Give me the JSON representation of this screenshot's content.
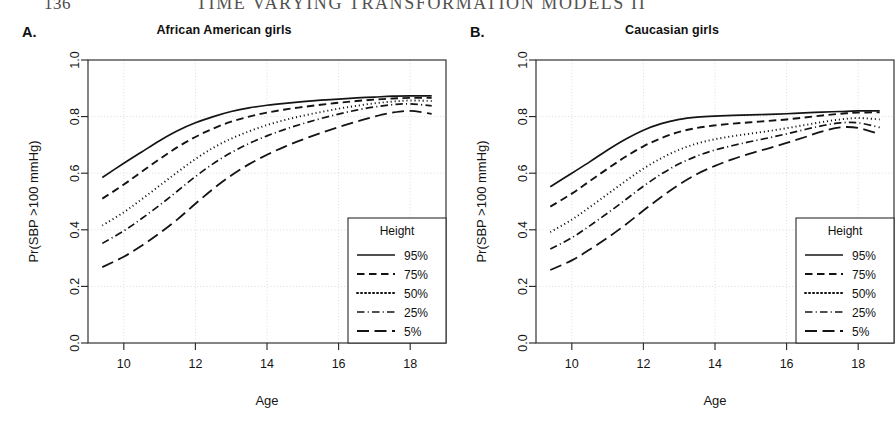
{
  "header": {
    "page_number": "136",
    "running_title": "TIME VARYING TRANSFORMATION MODELS  II"
  },
  "panels": [
    {
      "letter": "A.",
      "title": "African American girls",
      "xlabel": "Age",
      "ylabel": "Pr(SBP >100 mmHg)",
      "legend_title": "Height"
    },
    {
      "letter": "B.",
      "title": "Caucasian girls",
      "xlabel": "Age",
      "ylabel": "Pr(SBP >100 mmHg)",
      "legend_title": "Height"
    }
  ],
  "chart_data": [
    {
      "type": "line",
      "panel": "A",
      "title": "African American girls",
      "xlabel": "Age",
      "ylabel": "Pr(SBP >100 mmHg)",
      "xlim": [
        9.0,
        19.0
      ],
      "ylim": [
        0.0,
        1.0
      ],
      "xticks": [
        10,
        12,
        14,
        16,
        18
      ],
      "yticks": [
        0.0,
        0.2,
        0.4,
        0.6,
        0.8,
        1.0
      ],
      "grid": true,
      "legend_position": "bottom-right",
      "legend_title": "Height",
      "x": [
        9.4,
        10,
        10.5,
        11,
        11.5,
        12,
        12.5,
        13,
        13.5,
        14,
        14.5,
        15,
        15.5,
        16,
        16.5,
        17,
        17.5,
        18,
        18.6
      ],
      "series": [
        {
          "name": "95%",
          "dash": "solid",
          "values": [
            0.585,
            0.635,
            0.675,
            0.715,
            0.75,
            0.778,
            0.8,
            0.818,
            0.831,
            0.84,
            0.847,
            0.853,
            0.858,
            0.862,
            0.866,
            0.869,
            0.872,
            0.873,
            0.873
          ]
        },
        {
          "name": "75%",
          "dash": "dashed",
          "values": [
            0.51,
            0.56,
            0.605,
            0.65,
            0.692,
            0.728,
            0.758,
            0.782,
            0.8,
            0.814,
            0.825,
            0.834,
            0.842,
            0.849,
            0.855,
            0.86,
            0.864,
            0.866,
            0.866
          ]
        },
        {
          "name": "50%",
          "dash": "dotted",
          "values": [
            0.415,
            0.462,
            0.508,
            0.556,
            0.604,
            0.65,
            0.69,
            0.722,
            0.748,
            0.77,
            0.788,
            0.803,
            0.816,
            0.828,
            0.838,
            0.847,
            0.853,
            0.857,
            0.855
          ]
        },
        {
          "name": "25%",
          "dash": "dashdot",
          "values": [
            0.352,
            0.396,
            0.44,
            0.487,
            0.537,
            0.588,
            0.634,
            0.673,
            0.705,
            0.732,
            0.755,
            0.775,
            0.793,
            0.809,
            0.823,
            0.834,
            0.842,
            0.845,
            0.838
          ]
        },
        {
          "name": "5%",
          "dash": "longdash",
          "values": [
            0.268,
            0.305,
            0.344,
            0.388,
            0.437,
            0.492,
            0.545,
            0.592,
            0.632,
            0.665,
            0.694,
            0.719,
            0.742,
            0.763,
            0.782,
            0.8,
            0.814,
            0.82,
            0.81
          ]
        }
      ]
    },
    {
      "type": "line",
      "panel": "B",
      "title": "Caucasian girls",
      "xlabel": "Age",
      "ylabel": "Pr(SBP >100 mmHg)",
      "xlim": [
        9.0,
        19.0
      ],
      "ylim": [
        0.0,
        1.0
      ],
      "xticks": [
        10,
        12,
        14,
        16,
        18
      ],
      "yticks": [
        0.0,
        0.2,
        0.4,
        0.6,
        0.8,
        1.0
      ],
      "grid": true,
      "legend_position": "bottom-right",
      "legend_title": "Height",
      "x": [
        9.4,
        10,
        10.5,
        11,
        11.5,
        12,
        12.5,
        13,
        13.5,
        14,
        14.5,
        15,
        15.5,
        16,
        16.5,
        17,
        17.5,
        18,
        18.6
      ],
      "series": [
        {
          "name": "95%",
          "dash": "solid",
          "values": [
            0.552,
            0.6,
            0.64,
            0.682,
            0.72,
            0.752,
            0.775,
            0.79,
            0.798,
            0.802,
            0.804,
            0.806,
            0.808,
            0.81,
            0.813,
            0.816,
            0.818,
            0.82,
            0.82
          ]
        },
        {
          "name": "75%",
          "dash": "dashed",
          "values": [
            0.482,
            0.528,
            0.572,
            0.616,
            0.658,
            0.695,
            0.724,
            0.746,
            0.76,
            0.769,
            0.775,
            0.78,
            0.785,
            0.79,
            0.797,
            0.804,
            0.81,
            0.814,
            0.815
          ]
        },
        {
          "name": "50%",
          "dash": "dotted",
          "values": [
            0.392,
            0.436,
            0.48,
            0.526,
            0.572,
            0.616,
            0.653,
            0.683,
            0.705,
            0.72,
            0.731,
            0.74,
            0.749,
            0.759,
            0.77,
            0.781,
            0.79,
            0.795,
            0.79
          ]
        },
        {
          "name": "25%",
          "dash": "dashdot",
          "values": [
            0.332,
            0.372,
            0.414,
            0.459,
            0.506,
            0.554,
            0.597,
            0.633,
            0.661,
            0.682,
            0.698,
            0.712,
            0.725,
            0.739,
            0.754,
            0.768,
            0.778,
            0.778,
            0.762
          ]
        },
        {
          "name": "5%",
          "dash": "longdash",
          "values": [
            0.258,
            0.292,
            0.33,
            0.372,
            0.418,
            0.468,
            0.516,
            0.56,
            0.597,
            0.626,
            0.65,
            0.67,
            0.688,
            0.707,
            0.727,
            0.748,
            0.762,
            0.76,
            0.738
          ]
        }
      ]
    }
  ]
}
